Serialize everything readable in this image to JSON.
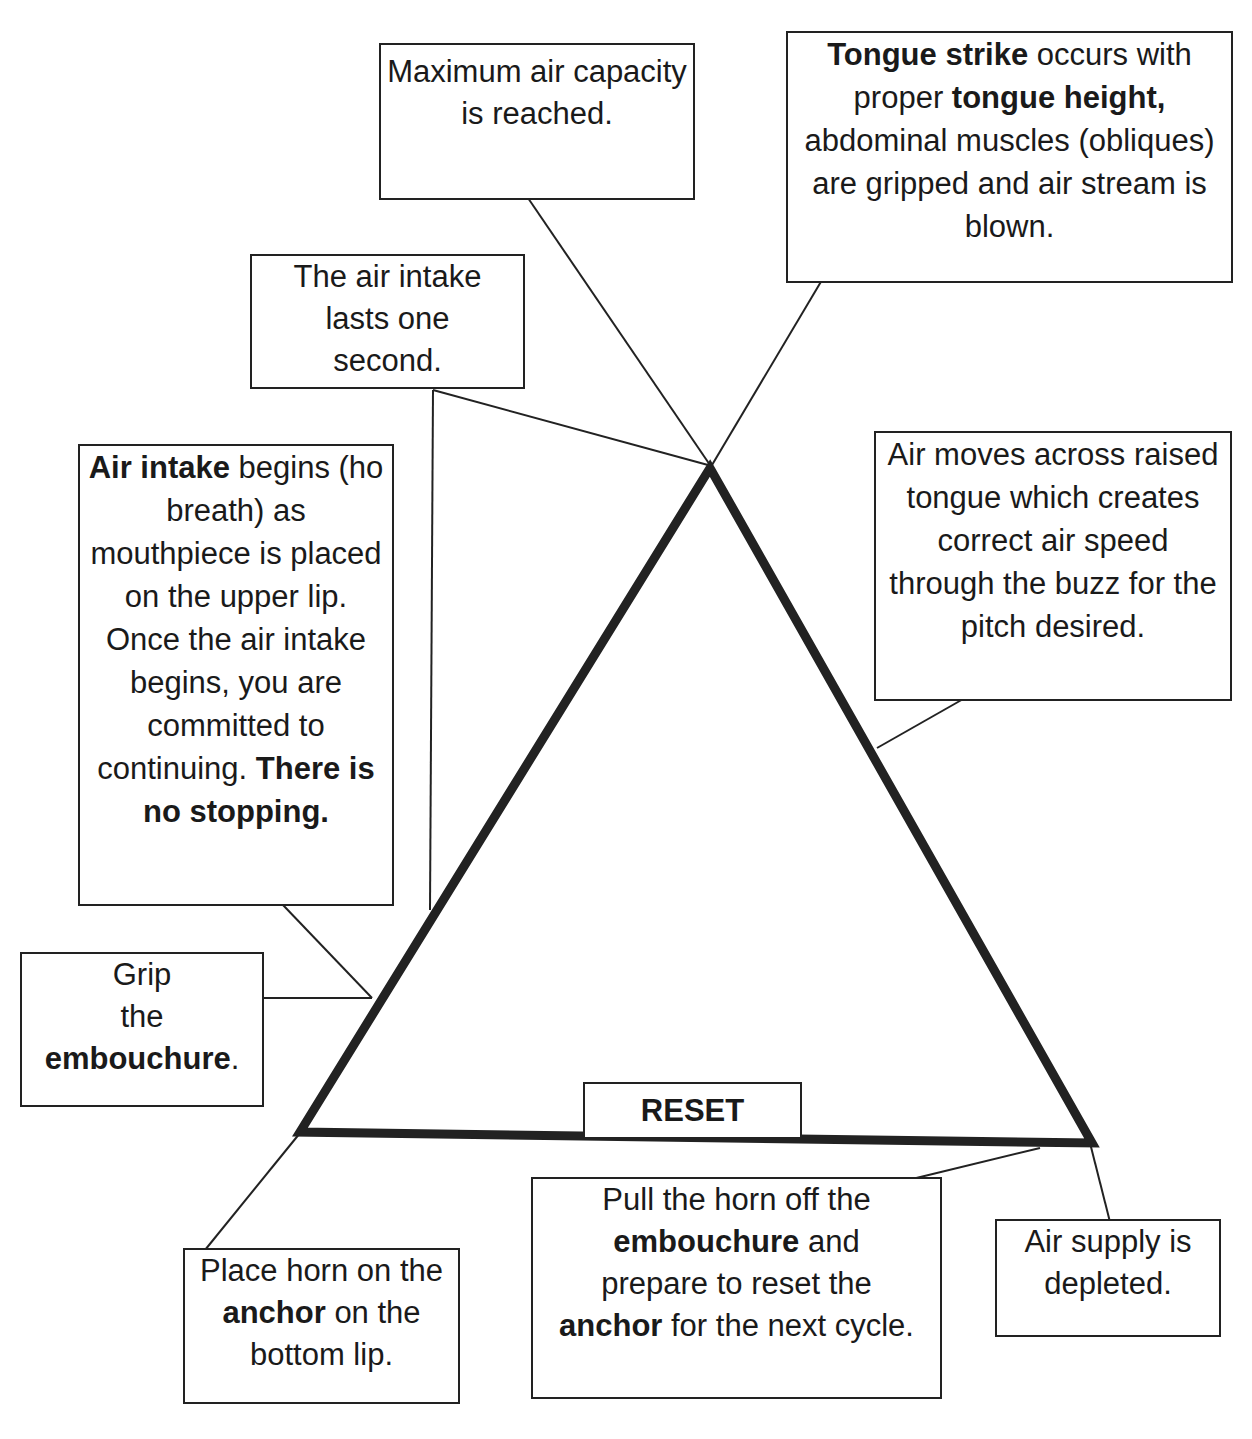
{
  "diagram": {
    "type": "cycle-triangle",
    "title": "",
    "colors": {
      "stroke": "#222222",
      "background": "#ffffff",
      "text": "#1a1a1a"
    },
    "reset_label": "RESET",
    "boxes": {
      "max_air": {
        "segments": [
          {
            "text": "Maximum air capacity is reached.",
            "bold": false
          }
        ]
      },
      "tongue_strike": {
        "segments": [
          {
            "text": "Tongue strike",
            "bold": true
          },
          {
            "text": " occurs with proper ",
            "bold": false
          },
          {
            "text": "tongue height,",
            "bold": true
          },
          {
            "text": " abdominal muscles (obliques) are gripped and air stream is blown.",
            "bold": false
          }
        ]
      },
      "intake_lasts": {
        "segments": [
          {
            "text": "The air intake lasts one second.",
            "bold": false
          }
        ]
      },
      "intake_begins": {
        "segments": [
          {
            "text": "Air intake",
            "bold": true
          },
          {
            "text": " begins (ho breath) as mouthpiece is placed on the upper lip. Once the air intake begins, you are committed to continuing. ",
            "bold": false
          },
          {
            "text": "There is no stopping.",
            "bold": true
          }
        ]
      },
      "air_moves": {
        "segments": [
          {
            "text": "Air moves across raised tongue which creates correct air speed through the buzz for the pitch desired.",
            "bold": false
          }
        ]
      },
      "grip": {
        "segments": [
          {
            "text": "Grip the ",
            "bold": false
          },
          {
            "text": "embouchure",
            "bold": true
          },
          {
            "text": ".",
            "bold": false
          }
        ]
      },
      "place_horn": {
        "segments": [
          {
            "text": "Place horn on the ",
            "bold": false
          },
          {
            "text": "anchor",
            "bold": true
          },
          {
            "text": " on the bottom lip.",
            "bold": false
          }
        ]
      },
      "pull_horn": {
        "segments": [
          {
            "text": "Pull the horn off the ",
            "bold": false
          },
          {
            "text": "embouchure",
            "bold": true
          },
          {
            "text": " and prepare to reset the ",
            "bold": false
          },
          {
            "text": "anchor",
            "bold": true
          },
          {
            "text": " for the next cycle.",
            "bold": false
          }
        ]
      },
      "depleted": {
        "segments": [
          {
            "text": "Air supply is depleted.",
            "bold": false
          }
        ]
      }
    }
  }
}
